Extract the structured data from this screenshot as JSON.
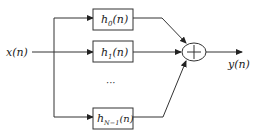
{
  "diagram": {
    "type": "parallel-filter-bank",
    "input": {
      "label": "x(n)"
    },
    "output": {
      "label": "y(n)"
    },
    "filters": [
      {
        "base": "h",
        "sub": "0",
        "arg": "(n)"
      },
      {
        "base": "h",
        "sub": "1",
        "arg": "(n)"
      },
      {
        "base": "h",
        "sub": "N−1",
        "arg": "(n)"
      }
    ],
    "ellipsis": "···",
    "summer": {
      "symbol": "+"
    }
  }
}
